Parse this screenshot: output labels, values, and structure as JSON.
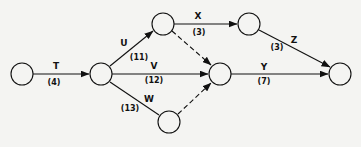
{
  "diagram": {
    "type": "activity-on-arrow network",
    "nodes": [
      {
        "id": "n1",
        "x": 22,
        "y": 74
      },
      {
        "id": "n2",
        "x": 101,
        "y": 74
      },
      {
        "id": "n3",
        "x": 163,
        "y": 24
      },
      {
        "id": "n4",
        "x": 220,
        "y": 74
      },
      {
        "id": "n5",
        "x": 169,
        "y": 122
      },
      {
        "id": "n6",
        "x": 249,
        "y": 24
      },
      {
        "id": "n7",
        "x": 340,
        "y": 74
      }
    ],
    "activities": [
      {
        "name": "T",
        "duration": "(4)",
        "from": "n1",
        "to": "n2"
      },
      {
        "name": "U",
        "duration": "(11)",
        "from": "n2",
        "to": "n3"
      },
      {
        "name": "V",
        "duration": "(12)",
        "from": "n2",
        "to": "n4"
      },
      {
        "name": "W",
        "duration": "(13)",
        "from": "n2",
        "to": "n5"
      },
      {
        "name": "X",
        "duration": "(3)",
        "from": "n3",
        "to": "n6"
      },
      {
        "name": "Y",
        "duration": "(7)",
        "from": "n4",
        "to": "n7"
      },
      {
        "name": "Z",
        "duration": "(3)",
        "from": "n6",
        "to": "n7"
      }
    ],
    "dummies": [
      {
        "from": "n3",
        "to": "n4"
      },
      {
        "from": "n5",
        "to": "n4"
      }
    ]
  }
}
